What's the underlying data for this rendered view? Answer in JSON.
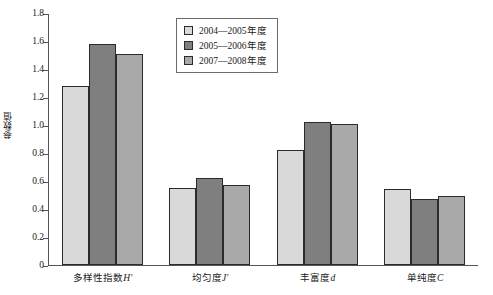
{
  "chart_data": {
    "type": "bar",
    "title": "",
    "xlabel": "",
    "ylabel": "参数值",
    "ylim": [
      0,
      1.8
    ],
    "ytick_step": 0.2,
    "yticks": [
      "0",
      "0.2",
      "0.4",
      "0.6",
      "0.8",
      "1.0",
      "1.2",
      "1.4",
      "1.6",
      "1.8"
    ],
    "grid": false,
    "legend_position": "top-center",
    "categories": [
      "多样性指数H′",
      "均匀度J′",
      "丰富度d",
      "单纯度C"
    ],
    "category_parts": [
      {
        "name": "多样性指数",
        "symbol": "H′"
      },
      {
        "name": "均匀度",
        "symbol": "J′"
      },
      {
        "name": "丰富度",
        "symbol": "d"
      },
      {
        "name": "单纯度",
        "symbol": "C"
      }
    ],
    "series": [
      {
        "name": "2004—2005年度",
        "color": "#d9d9d9",
        "values": [
          1.28,
          0.55,
          0.82,
          0.545
        ]
      },
      {
        "name": "2005—2006年度",
        "color": "#7f7f7f",
        "values": [
          1.58,
          0.625,
          1.025,
          0.475
        ]
      },
      {
        "name": "2007—2008年度",
        "color": "#a9a9a9",
        "values": [
          1.51,
          0.57,
          1.01,
          0.49
        ]
      }
    ]
  },
  "legend": {
    "items": [
      {
        "label": "2004—2005年度",
        "color": "#d9d9d9"
      },
      {
        "label": "2005—2006年度",
        "color": "#7f7f7f"
      },
      {
        "label": "2007—2008年度",
        "color": "#a9a9a9"
      }
    ]
  },
  "axes": {
    "y_title": "参数值",
    "axis_color": "#555555",
    "bar_edge_color": "#2b2b2b"
  }
}
